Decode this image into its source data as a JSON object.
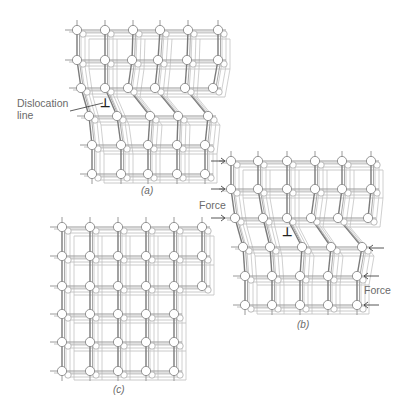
{
  "figure": {
    "panels": [
      {
        "id": "a",
        "caption": "(a)",
        "caption_pos": [
          141,
          185
        ],
        "rows": [
          {
            "y": 30,
            "xs": [
              77,
              105,
              133,
              160,
              188,
              218
            ]
          },
          {
            "y": 60,
            "xs": [
              77,
              105,
              132,
              158,
              187,
              218
            ]
          },
          {
            "y": 88,
            "xs": [
              81,
              105,
              128,
              155,
              185,
              213
            ]
          },
          {
            "y": 116,
            "xs": [
              89,
              117,
              150,
              178,
              208
            ]
          },
          {
            "y": 145,
            "xs": [
              92,
              121,
              148,
              177,
              205
            ]
          },
          {
            "y": 174,
            "xs": [
              92,
              121,
              148,
              177,
              205
            ]
          }
        ],
        "dislocation": {
          "symbol": "⊥",
          "pos": [
            100,
            97
          ]
        }
      },
      {
        "id": "b",
        "caption": "(b)",
        "caption_pos": [
          297,
          319
        ],
        "rows": [
          {
            "y": 161,
            "xs": [
              231,
              258,
              287,
              315,
              342,
              371
            ]
          },
          {
            "y": 189,
            "xs": [
              231,
              258,
              287,
              315,
              342,
              371
            ]
          },
          {
            "y": 218,
            "xs": [
              235,
              263,
              287,
              311,
              338,
              368
            ]
          },
          {
            "y": 247,
            "xs": [
              243,
              270,
              302,
              331,
              362
            ]
          },
          {
            "y": 276,
            "xs": [
              245,
              272,
              300,
              328,
              357
            ]
          },
          {
            "y": 305,
            "xs": [
              245,
              272,
              300,
              328,
              357
            ]
          }
        ],
        "dislocation": {
          "symbol": "⊥",
          "pos": [
            282,
            226
          ]
        },
        "forces": {
          "left_label": "Force",
          "left_label_pos": [
            199,
            199
          ],
          "left_arrows_y": [
            161,
            189,
            218
          ],
          "right_label": "Force",
          "right_label_pos": [
            364,
            284
          ],
          "right_arrows_y": [
            248,
            276,
            305
          ]
        }
      },
      {
        "id": "c",
        "caption": "(c)",
        "caption_pos": [
          113,
          384
        ],
        "rows": [
          {
            "y": 227,
            "xs": [
              62,
              90,
              118,
              146,
              174,
              202
            ]
          },
          {
            "y": 256,
            "xs": [
              62,
              90,
              118,
              146,
              174,
              202
            ]
          },
          {
            "y": 286,
            "xs": [
              62,
              90,
              118,
              146,
              174,
              202
            ]
          },
          {
            "y": 314,
            "xs": [
              62,
              90,
              118,
              146,
              174
            ]
          },
          {
            "y": 342,
            "xs": [
              62,
              90,
              118,
              146,
              174
            ]
          },
          {
            "y": 371,
            "xs": [
              62,
              90,
              118,
              146,
              174
            ]
          }
        ]
      }
    ],
    "labels": {
      "dislocation_line_1": "Dislocation",
      "dislocation_line_2": "line",
      "dislocation_label_pos": [
        17,
        97
      ],
      "leader": [
        70,
        111,
        103,
        103
      ]
    },
    "colors": {
      "bond": "#9a9a9a",
      "bond_dark": "#7a7a7a",
      "atom_fill": "#ffffff",
      "atom_stroke": "#8a8a8a",
      "text": "#6a6a6a"
    }
  }
}
